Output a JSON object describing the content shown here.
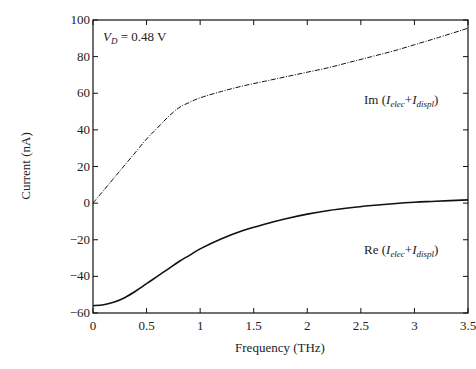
{
  "chart_data": {
    "type": "line",
    "title": "",
    "xlabel": "Frequency  (THz)",
    "ylabel": "Current  (nA)",
    "xlim": [
      0,
      3.5
    ],
    "ylim": [
      -60,
      100
    ],
    "xticks": [
      0,
      0.5,
      1,
      1.5,
      2,
      2.5,
      3,
      3.5
    ],
    "xtick_labels": [
      "0",
      "0.5",
      "1",
      "1.5",
      "2",
      "2.5",
      "3",
      "3.5"
    ],
    "yticks": [
      -60,
      -40,
      -20,
      0,
      20,
      40,
      60,
      80,
      100
    ],
    "ytick_labels": [
      "−60",
      "−40",
      "−20",
      "0",
      "20",
      "40",
      "60",
      "80",
      "100"
    ],
    "grid": false,
    "legend": null,
    "annotations": [
      {
        "text": "V_D = 0.48 V",
        "x": 0.05,
        "y": 90
      },
      {
        "text": "Im (I_elec+I_displ)",
        "x": 2.6,
        "y": 68
      },
      {
        "text": "Re (I_elec+I_displ)",
        "x": 2.6,
        "y": -20
      }
    ],
    "series": [
      {
        "name": "Im (I_elec+I_displ)",
        "style": "dash-dot",
        "x": [
          0,
          0.1,
          0.2,
          0.3,
          0.4,
          0.5,
          0.6,
          0.7,
          0.8,
          0.9,
          1.0,
          1.2,
          1.4,
          1.6,
          1.8,
          2.0,
          2.2,
          2.4,
          2.6,
          2.8,
          3.0,
          3.2,
          3.5
        ],
        "y": [
          0,
          7,
          14,
          21,
          28,
          35,
          41,
          47,
          52,
          55,
          57.5,
          61,
          64,
          66.5,
          69,
          71.5,
          74,
          77,
          80,
          83,
          86.5,
          90,
          95.5
        ]
      },
      {
        "name": "Re (I_elec+I_displ)",
        "style": "solid",
        "x": [
          0,
          0.1,
          0.2,
          0.3,
          0.4,
          0.5,
          0.6,
          0.7,
          0.8,
          0.9,
          1.0,
          1.2,
          1.4,
          1.6,
          1.8,
          2.0,
          2.2,
          2.4,
          2.6,
          2.8,
          3.0,
          3.2,
          3.5
        ],
        "y": [
          -56,
          -55.5,
          -54,
          -51.5,
          -48,
          -44,
          -40,
          -36,
          -32,
          -28.5,
          -25,
          -19.5,
          -15,
          -11.5,
          -8.5,
          -6,
          -4,
          -2.5,
          -1.3,
          -0.3,
          0.5,
          1,
          1.8
        ]
      }
    ]
  },
  "labels": {
    "vd_prefix": "V",
    "vd_sub": "D",
    "vd_value": " = 0.48 V",
    "im_prefix": "Im (",
    "re_prefix": "Re (",
    "i1": "I",
    "sub1": "elec",
    "plus": "+",
    "i2": "I",
    "sub2": "displ",
    "close": ")"
  }
}
